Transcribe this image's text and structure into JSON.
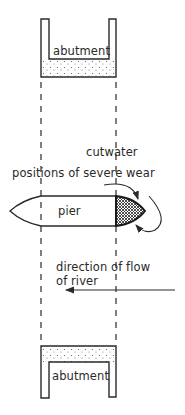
{
  "figure": {
    "type": "engineering-plan-diagram",
    "labels": {
      "top_abutment": "abutment",
      "bottom_abutment": "abutment",
      "pier": "pier",
      "cutwater": "cutwater",
      "wear": "positions of severe wear",
      "flow_line1": "direction of flow",
      "flow_line2": "of river"
    },
    "colors": {
      "ink": "#2a2a2a",
      "background": "#ffffff"
    }
  }
}
